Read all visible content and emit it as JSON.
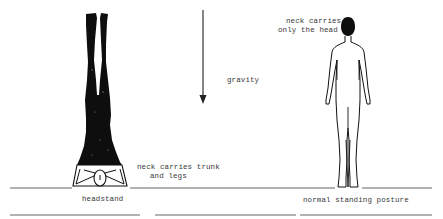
{
  "diagram": {
    "colors": {
      "ink": "#111111",
      "line": "#555555",
      "text": "#3a3a3a",
      "background": "#ffffff"
    },
    "arrow": {
      "label": "gravity",
      "direction": "down"
    },
    "figures": [
      {
        "id": "headstand",
        "caption": "headstand",
        "annotation_line1": "neck carries trunk",
        "annotation_line2": "and legs"
      },
      {
        "id": "standing",
        "caption": "normal standing posture",
        "annotation_line1": "neck carries",
        "annotation_line2": "only the head"
      }
    ]
  }
}
